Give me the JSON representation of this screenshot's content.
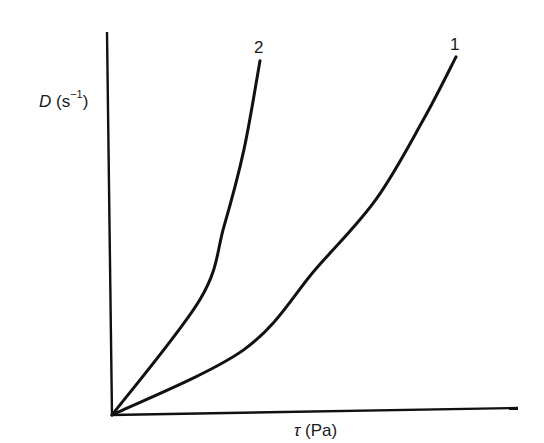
{
  "chart_data": {
    "type": "line",
    "title": "",
    "xlabel": "τ (Pa)",
    "ylabel": "D (s⁻¹)",
    "xlabel_parts": {
      "symbol": "τ",
      "unit": " (Pa)"
    },
    "ylabel_parts": {
      "symbol": "D",
      "unit_open": " (s",
      "superscript": "−1",
      "unit_close": ")"
    },
    "grid": false,
    "legend": "none (curves labelled inline at their ends)",
    "axis_ticks": "none",
    "xlim": [
      0,
      1
    ],
    "ylim": [
      0,
      1
    ],
    "series": [
      {
        "name": "1",
        "label": "1",
        "description": "shear-thickening-like curve, lower slope",
        "x": [
          0.0,
          0.33,
          0.51,
          0.66,
          0.78,
          0.86
        ],
        "y": [
          0.0,
          0.17,
          0.38,
          0.56,
          0.77,
          0.93
        ]
      },
      {
        "name": "2",
        "label": "2",
        "description": "steeper curve",
        "x": [
          0.0,
          0.22,
          0.28,
          0.33,
          0.37
        ],
        "y": [
          0.0,
          0.3,
          0.49,
          0.69,
          0.92
        ]
      }
    ]
  },
  "labels": {
    "curve_1": "1",
    "curve_2": "2"
  },
  "colors": {
    "line": "#111111",
    "background": "#ffffff"
  }
}
